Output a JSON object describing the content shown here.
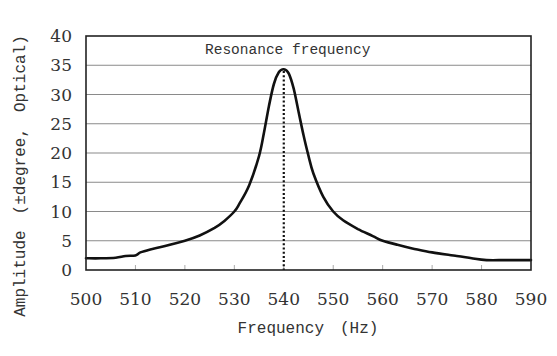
{
  "chart_data": {
    "type": "line",
    "title": "",
    "xlabel": "Frequency　(Hz)",
    "ylabel": "Amplitude　(±degree,　Optical)",
    "xlim": [
      500,
      590
    ],
    "ylim": [
      0,
      40
    ],
    "xticks": [
      500,
      510,
      520,
      530,
      540,
      550,
      560,
      570,
      580,
      590
    ],
    "yticks": [
      0,
      5,
      10,
      15,
      20,
      25,
      30,
      35,
      40
    ],
    "grid": {
      "horizontal": true,
      "vertical": false
    },
    "legend": null,
    "annotations": [
      {
        "text": "Resonance frequency",
        "x": 540,
        "type": "dotted-vertical-line"
      }
    ],
    "series": [
      {
        "name": "Amplitude",
        "x": [
          500,
          503,
          506,
          508,
          510,
          511,
          513,
          516,
          520,
          523,
          526,
          528,
          530,
          531,
          533,
          535,
          536,
          537,
          538,
          539,
          540,
          541,
          542,
          543,
          544,
          545,
          546,
          548,
          550,
          552,
          555,
          558,
          560,
          563,
          566,
          570,
          575,
          578,
          581,
          585,
          590
        ],
        "values": [
          2.0,
          2.0,
          2.1,
          2.4,
          2.5,
          3.0,
          3.5,
          4.1,
          5.0,
          5.9,
          7.2,
          8.4,
          10.0,
          11.3,
          14.5,
          19.5,
          23.5,
          28.0,
          31.8,
          33.8,
          34.3,
          33.6,
          31.0,
          27.0,
          23.0,
          19.5,
          16.5,
          12.5,
          10.0,
          8.5,
          7.0,
          5.8,
          5.0,
          4.3,
          3.7,
          3.0,
          2.4,
          2.0,
          1.7,
          1.7,
          1.7
        ]
      }
    ]
  }
}
